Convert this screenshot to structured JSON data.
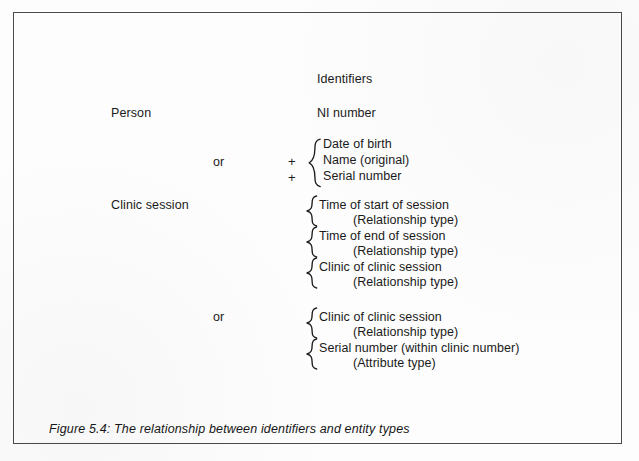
{
  "figure": {
    "caption": "Figure 5.4: The relationship between identifiers and entity types",
    "column_header": "Identifiers",
    "or_label": "or",
    "plus_label": "+"
  },
  "rows": {
    "person": {
      "entity": "Person",
      "primary_identifier": "NI  number",
      "alternate_group": [
        "Date of birth",
        "Name (original)",
        "Serial number"
      ]
    },
    "clinic_session": {
      "entity": "Clinic session",
      "primary_group": [
        {
          "identifier": "Time of start of session",
          "type": "(Relationship type)"
        },
        {
          "identifier": "Time of end of session",
          "type": "(Relationship type)"
        },
        {
          "identifier": "Clinic of clinic session",
          "type": "(Relationship type)"
        }
      ],
      "alternate_group": [
        {
          "identifier": "Clinic of clinic session",
          "type": "(Relationship type)"
        },
        {
          "identifier": "Serial number (within clinic number)",
          "type": "(Attribute type)"
        }
      ]
    }
  },
  "colors": {
    "frame": "#4a4a4a",
    "ink": "#1a1a1a",
    "page": "#fdfdfd"
  }
}
